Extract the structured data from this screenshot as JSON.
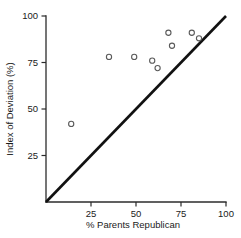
{
  "chart_data": {
    "type": "scatter",
    "title": "",
    "xlabel": "% Parents Republican",
    "ylabel": "Index of Deviation (%)",
    "xlim": [
      0,
      100
    ],
    "ylim": [
      0,
      100
    ],
    "grid": false,
    "legend": "none",
    "x_ticks": [
      25,
      50,
      75,
      100
    ],
    "y_ticks": [
      25,
      50,
      75,
      100
    ],
    "x_tick_labels": [
      "25",
      "50",
      "75",
      "100"
    ],
    "y_tick_labels": [
      "25",
      "50",
      "75",
      "100"
    ],
    "points": [
      {
        "x": 14,
        "y": 42
      },
      {
        "x": 35,
        "y": 78
      },
      {
        "x": 49,
        "y": 78
      },
      {
        "x": 59,
        "y": 76
      },
      {
        "x": 62,
        "y": 72
      },
      {
        "x": 68,
        "y": 91
      },
      {
        "x": 70,
        "y": 84
      },
      {
        "x": 81,
        "y": 91
      },
      {
        "x": 85,
        "y": 88
      }
    ],
    "reference_line": {
      "name": "identity-line",
      "from": [
        0,
        0
      ],
      "to": [
        100,
        100
      ]
    },
    "marker": "open-circle",
    "marker_color": "#5a5a5a",
    "line_color": "#111111"
  }
}
